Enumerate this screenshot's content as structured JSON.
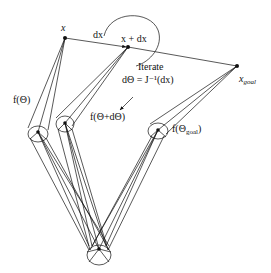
{
  "diagram": {
    "labels": {
      "x": "x",
      "dx": "dx",
      "x_plus_dx": "x + dx",
      "x_goal": "x",
      "x_goal_sub": "goal",
      "iterate_line1": "Iterate",
      "iterate_line2": "dΘ = J⁻¹(dx)",
      "f_theta": "f(Θ)",
      "f_theta_dtheta": "f(Θ+dΘ)",
      "f_theta_goal_prefix": "f(Θ",
      "f_theta_goal_sub": "goal",
      "f_theta_goal_suffix": ")"
    },
    "points": {
      "x": [
        65,
        38
      ],
      "x_plus_dx": [
        128,
        47
      ],
      "x_goal": [
        237,
        66
      ],
      "joint_theta": [
        38,
        132
      ],
      "joint_theta_dtheta": [
        65,
        123
      ],
      "joint_theta_goal": [
        158,
        130
      ],
      "base": [
        99,
        249
      ]
    },
    "colors": {
      "stroke": "#111111",
      "background": "#ffffff"
    }
  }
}
